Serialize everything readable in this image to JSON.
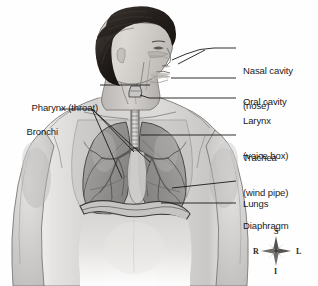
{
  "figure": {
    "background_color": "#fefefe",
    "line_color": "#1a1a1a",
    "text_color": "#1a1a1a"
  },
  "labels": {
    "left": [
      {
        "id": "pharynx",
        "text": "Pharynx (throat)",
        "lines": [
          "Pharynx (throat)"
        ],
        "text_x": 98,
        "text_y": 79,
        "leader_from_x": 100,
        "leader_from_y": 85,
        "leader_to_x": 150,
        "leader_to_y": 85
      },
      {
        "id": "bronchi",
        "text": "Bronchi",
        "lines": [
          "Bronchi"
        ],
        "text_x": 58,
        "text_y": 103,
        "leader_from_x": 60,
        "leader_from_y": 109,
        "leader_to_x": 92,
        "leader_to_y": 109
      }
    ],
    "right": [
      {
        "id": "nasal-cavity",
        "text": "Nasal cavity (nose)",
        "lines": [
          "Nasal cavity",
          "(nose)"
        ],
        "text_x": 243,
        "text_y": 42,
        "leader_from_x": 236,
        "leader_from_y": 48,
        "leader_to_x": 214,
        "leader_to_y": 48
      },
      {
        "id": "oral-cavity",
        "text": "Oral cavity",
        "lines": [
          "Oral cavity"
        ],
        "text_x": 243,
        "text_y": 73,
        "leader_from_x": 236,
        "leader_from_y": 78,
        "leader_to_x": 171,
        "leader_to_y": 78
      },
      {
        "id": "larynx",
        "text": "Larynx (voice box)",
        "lines": [
          "Larynx",
          "(voice box)"
        ],
        "text_x": 243,
        "text_y": 93,
        "leader_from_x": 236,
        "leader_from_y": 98,
        "leader_to_x": 149,
        "leader_to_y": 98
      },
      {
        "id": "trachea",
        "text": "Trachea (wind pipe)",
        "lines": [
          "Trachea",
          "(wind pipe)"
        ],
        "text_x": 243,
        "text_y": 130,
        "leader_from_x": 236,
        "leader_from_y": 135,
        "leader_to_x": 141,
        "leader_to_y": 135
      },
      {
        "id": "lungs",
        "text": "Lungs",
        "lines": [
          "Lungs"
        ],
        "text_x": 243,
        "text_y": 176,
        "leader_from_x": 236,
        "leader_from_y": 181,
        "leader_to_x": 172,
        "leader_to_y": 188
      },
      {
        "id": "diaphragm",
        "text": "Diaphragm",
        "lines": [
          "Diaphragm"
        ],
        "text_x": 243,
        "text_y": 198,
        "leader_from_x": 236,
        "leader_from_y": 203,
        "leader_to_x": 161,
        "leader_to_y": 203
      }
    ]
  },
  "compass": {
    "name": "anatomical-orientation-compass",
    "center_x": 276,
    "center_y": 251,
    "superior": "S",
    "inferior": "I",
    "right": "R",
    "left": "L"
  },
  "anatomy": {
    "parts": [
      "head",
      "hair",
      "nose",
      "oral cavity",
      "pharynx",
      "larynx",
      "trachea",
      "bronchi",
      "left lung",
      "right lung",
      "diaphragm",
      "torso",
      "shoulders",
      "arms",
      "abdomen"
    ],
    "skin_tone": "#d4d2d0",
    "hair_color": "#2b2623",
    "lung_tone": "#9a9a9a",
    "shading": "grayscale"
  }
}
